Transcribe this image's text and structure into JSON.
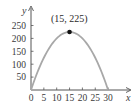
{
  "chart_data": {
    "type": "line",
    "title": "",
    "xlabel": "x",
    "ylabel": "y",
    "xlim": [
      0,
      33
    ],
    "ylim": [
      0,
      275
    ],
    "x_ticks": [
      0,
      5,
      10,
      15,
      20,
      25,
      30
    ],
    "x_tick_labels": [
      "0",
      "5",
      "10",
      "15",
      "20",
      "25",
      "30"
    ],
    "y_ticks": [
      50,
      100,
      150,
      200,
      250
    ],
    "y_tick_labels": [
      "50",
      "100",
      "150",
      "200",
      "250"
    ],
    "grid": false,
    "legend": null,
    "series": [
      {
        "name": "parabola",
        "equation": "y = 30x - x^2",
        "x": [
          0,
          2.5,
          5,
          7.5,
          10,
          12.5,
          15,
          17.5,
          20,
          22.5,
          25,
          27.5,
          30
        ],
        "y": [
          0,
          68.75,
          125,
          168.75,
          200,
          218.75,
          225,
          218.75,
          200,
          168.75,
          125,
          68.75,
          0
        ],
        "color": "#a8a8a8"
      }
    ],
    "annotations": [
      {
        "text": "(15, 225)",
        "x": 15,
        "y": 225,
        "marker": "dot"
      }
    ]
  },
  "colors": {
    "axis": "#555555",
    "curve": "#a8a8a8",
    "marker": "#111111"
  }
}
